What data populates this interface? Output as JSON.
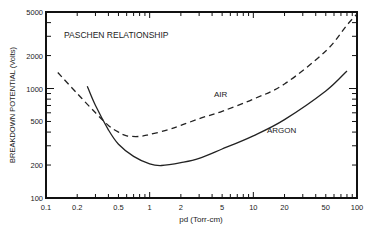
{
  "chart_data": {
    "type": "line",
    "title": "PASCHEN RELATIONSHIP",
    "xlabel": "pd (Torr-cm)",
    "ylabel": "BREAKDOWN POTENTIAL (Volts)",
    "xscale": "log",
    "yscale": "log",
    "xlim": [
      0.1,
      100
    ],
    "ylim": [
      100,
      5000
    ],
    "x_ticks": [
      "0.1",
      "0.2",
      "0.5",
      "1",
      "2",
      "5",
      "10",
      "20",
      "50",
      "100"
    ],
    "y_ticks": [
      "100",
      "200",
      "500",
      "1000",
      "2000",
      "5000"
    ],
    "grid": false,
    "series": [
      {
        "name": "AIR",
        "style": "dashed",
        "points": [
          [
            0.13,
            1400
          ],
          [
            0.2,
            900
          ],
          [
            0.3,
            600
          ],
          [
            0.4,
            460
          ],
          [
            0.5,
            400
          ],
          [
            0.6,
            370
          ],
          [
            0.8,
            365
          ],
          [
            1,
            380
          ],
          [
            1.5,
            420
          ],
          [
            2,
            460
          ],
          [
            3,
            530
          ],
          [
            5,
            620
          ],
          [
            10,
            800
          ],
          [
            20,
            1100
          ],
          [
            50,
            2200
          ],
          [
            80,
            3800
          ],
          [
            100,
            4800
          ]
        ]
      },
      {
        "name": "ARGON",
        "style": "solid",
        "points": [
          [
            0.25,
            1050
          ],
          [
            0.3,
            700
          ],
          [
            0.4,
            420
          ],
          [
            0.5,
            310
          ],
          [
            0.7,
            240
          ],
          [
            1,
            205
          ],
          [
            1.3,
            198
          ],
          [
            2,
            210
          ],
          [
            3,
            230
          ],
          [
            5,
            280
          ],
          [
            10,
            370
          ],
          [
            20,
            520
          ],
          [
            50,
            950
          ],
          [
            80,
            1450
          ]
        ]
      }
    ],
    "annotations": [
      {
        "text": "PASCHEN RELATIONSHIP"
      },
      {
        "text": "AIR"
      },
      {
        "text": "ARGON"
      }
    ]
  }
}
